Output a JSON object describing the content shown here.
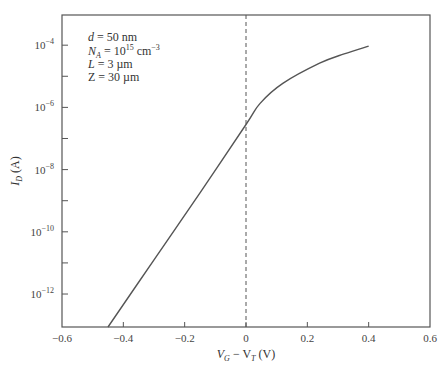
{
  "chart_data": {
    "type": "line",
    "title": "",
    "xlabel": "V_G − V_T (V)",
    "ylabel": "I_D (A)",
    "xlim": [
      -0.6,
      0.6
    ],
    "ylim_log10": [
      -13.06,
      -3.03
    ],
    "yscale": "log",
    "grid": false,
    "legend": null,
    "x_ticks": [
      -0.6,
      -0.4,
      -0.2,
      0,
      0.2,
      0.4,
      0.6
    ],
    "x_tick_labels": [
      "−0.6",
      "−0.4",
      "−0.2",
      "0",
      "0.2",
      "0.4",
      "0.6"
    ],
    "y_major_ticks_log10": [
      -4,
      -6,
      -8,
      -10,
      -12
    ],
    "y_tick_labels": [
      {
        "base": "10",
        "exp": "−4"
      },
      {
        "base": "10",
        "exp": "−6"
      },
      {
        "base": "10",
        "exp": "−8"
      },
      {
        "base": "10",
        "exp": "−10"
      },
      {
        "base": "10",
        "exp": "−12"
      }
    ],
    "y_minor_ticks_log10": [
      -5,
      -7,
      -9,
      -11
    ],
    "reference_line": {
      "x": 0,
      "style": "dashed"
    },
    "series": [
      {
        "name": "I_D",
        "x": [
          -0.45,
          -0.3,
          -0.15,
          0.0,
          0.046,
          0.12,
          0.24,
          0.32,
          0.4
        ],
        "log10_y": [
          -13.1,
          -10.9,
          -8.75,
          -6.55,
          -5.87,
          -5.23,
          -4.58,
          -4.28,
          -4.03
        ]
      }
    ],
    "annotations": [
      {
        "text": "d = 50 nm"
      },
      {
        "text": "N_A = 10^15 cm^−3"
      },
      {
        "text": "L = 3 µm"
      },
      {
        "text": "Z = 30 µm"
      }
    ]
  },
  "labels": {
    "annotation": {
      "d_sym": "d",
      "d_val": " = 50 nm",
      "na_sym": "N",
      "na_sub": "A",
      "na_val": " = 10",
      "na_exp": "15",
      "na_unit": " cm",
      "na_unit_exp": "−3",
      "l_sym": "L",
      "l_val": " = 3 µm",
      "z_sym": "Z",
      "z_val": " = 30 µm"
    },
    "xlabel": {
      "v1": "V",
      "s1": "G",
      "mid": " − V",
      "s2": "T",
      "unit": " (V)"
    },
    "ylabel": {
      "sym": "I",
      "sub": "D",
      "unit": " (A)"
    }
  }
}
